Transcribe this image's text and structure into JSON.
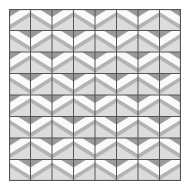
{
  "figure": {
    "kind": "geometric-tiling",
    "grid": {
      "rows": 8,
      "cols": 8,
      "cell_size": 21.5,
      "origin_x": 9,
      "origin_y": 9,
      "width": 172,
      "height": 172
    },
    "palette": {
      "page_background": "#ffffff",
      "cell_background": "#c8c8c8",
      "band_fill": "#fafafa",
      "wedge_dark": "#9a9a9a",
      "wedge_mid": "#b4b4b4",
      "wedge_light": "#dcdcdc",
      "grid_line": "#555555",
      "outer_border": "#555555",
      "band_edge": "#8c8c8c"
    },
    "band": {
      "description": "white parallelogram band crossing each cell diagonally",
      "thickness_ratio": 0.42,
      "slant_ratio": 0.62
    },
    "tiling_rule": "band slant direction alternates by (row + col) parity, producing a checkerboard of mirrored cells",
    "orientation_map": [
      [
        "a",
        "b",
        "a",
        "b",
        "a",
        "b",
        "a",
        "b"
      ],
      [
        "b",
        "a",
        "b",
        "a",
        "b",
        "a",
        "b",
        "a"
      ],
      [
        "a",
        "b",
        "a",
        "b",
        "a",
        "b",
        "a",
        "b"
      ],
      [
        "b",
        "a",
        "b",
        "a",
        "b",
        "a",
        "b",
        "a"
      ],
      [
        "a",
        "b",
        "a",
        "b",
        "a",
        "b",
        "a",
        "b"
      ],
      [
        "b",
        "a",
        "b",
        "a",
        "b",
        "a",
        "b",
        "a"
      ],
      [
        "a",
        "b",
        "a",
        "b",
        "a",
        "b",
        "a",
        "b"
      ],
      [
        "b",
        "a",
        "b",
        "a",
        "b",
        "a",
        "b",
        "a"
      ]
    ]
  }
}
